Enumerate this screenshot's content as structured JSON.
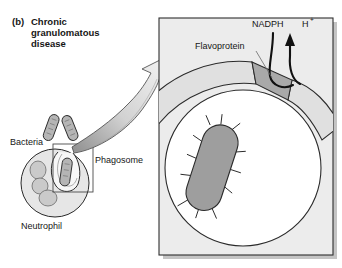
{
  "figure": {
    "panel_letter": "(b)",
    "title_line1": "Chronic",
    "title_line2": "granulomatous",
    "title_line3": "disease"
  },
  "labels": {
    "bacteria": "Bacteria",
    "phagosome": "Phagosome",
    "neutrophil": "Neutrophil",
    "flavoprotein": "Flavoprotein",
    "nadph": "NADPH",
    "proton": "H",
    "proton_charge": "+"
  },
  "colors": {
    "outline": "#1a1a1a",
    "cytoplasm_fill": "#e2e2e2",
    "panel_fill": "#ebebeb",
    "panel_border": "#3a3a3a",
    "bacterium_fill": "#9e9e9e",
    "nucleus_fill": "#c9c9c9",
    "flavoprotein_fill": "#a8a8a8",
    "phagosome_fill": "#ffffff",
    "arrow_fill": "#dcdcdc",
    "text": "#161616",
    "shadow": "#bdbdbd"
  },
  "icons": {
    "magnify_arrow": "magnify-arrow-icon",
    "nadph_arrow": "nadph-curved-arrow-icon",
    "proton_arrow": "proton-up-arrow-icon",
    "inset_box": "inset-selection-box"
  },
  "diagram_content": {
    "type": "biological-schematic",
    "left_scene": {
      "cell": "neutrophil",
      "bacteria_outside_count": 2,
      "bacteria_engulfed_count": 1,
      "nucleus_lobes": 3,
      "structure": "phagosome invagination engulfing bacterium"
    },
    "right_scene": {
      "magnified_structure": "phagosome with ingested bacterium",
      "membrane_component": "flavoprotein (NADPH oxidase)",
      "substrate_in": "NADPH",
      "product_out": "H+",
      "bacterium_flagella": true
    }
  }
}
